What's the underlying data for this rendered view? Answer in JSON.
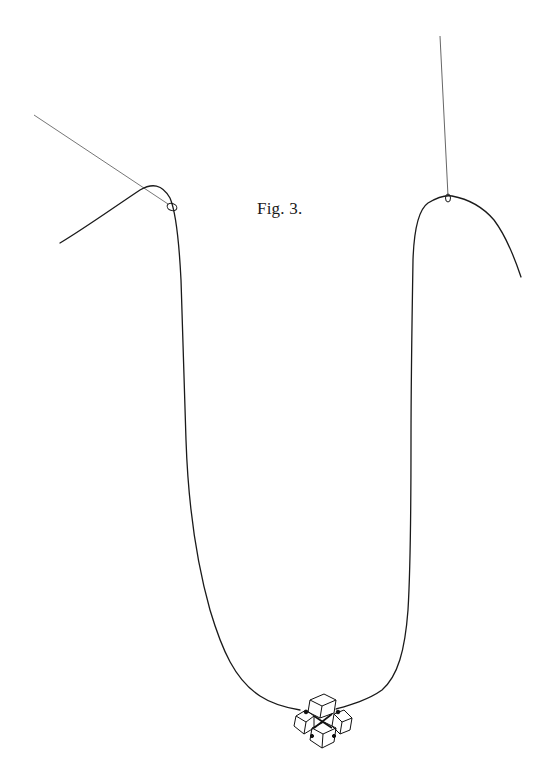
{
  "figure": {
    "label": "Fig. 3.",
    "colors": {
      "background": "#ffffff",
      "line": "#1a1a1a",
      "thin_line": "#555555"
    },
    "elements": [
      "left-support-thread",
      "right-support-thread",
      "main-hanging-thread",
      "left-loop",
      "right-loop",
      "crystal-pendant"
    ]
  }
}
